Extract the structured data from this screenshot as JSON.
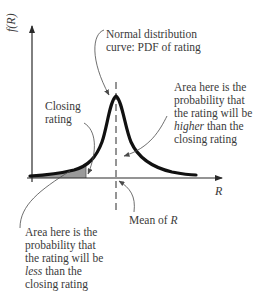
{
  "diagram": {
    "axes": {
      "y_label": "f(R)",
      "x_label": "R"
    },
    "labels": {
      "normal_curve": {
        "line1": "Normal distribution",
        "line2": "curve: PDF of rating"
      },
      "closing_rating": {
        "line1": "Closing",
        "line2": "rating"
      },
      "higher_area": {
        "line1": "Area here is the",
        "line2": "probability that",
        "line3": "the rating will be",
        "line4_em": "higher",
        "line4_rest": " than the",
        "line5": "closing rating"
      },
      "less_area": {
        "line1": "Area here is the",
        "line2": "probability that",
        "line3": "the rating will be",
        "line4_em": "less",
        "line4_rest": " than the",
        "line5": "closing rating"
      },
      "mean": {
        "prefix": "Mean of ",
        "var": "R"
      }
    },
    "colors": {
      "curve": "#111111",
      "axis": "#2a2a2a",
      "shade": "#9a9a9a",
      "text": "#3a3a3a",
      "leader": "#4a4a4a"
    }
  }
}
